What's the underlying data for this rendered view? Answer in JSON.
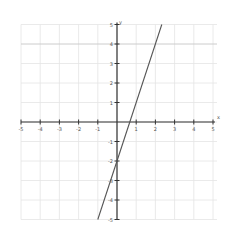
{
  "chart_data": {
    "type": "line",
    "title": "",
    "xlabel": "x",
    "ylabel": "y",
    "xlim": [
      -5,
      5
    ],
    "ylim": [
      -5,
      5
    ],
    "grid": true,
    "x_ticks": [
      -5,
      -4,
      -3,
      -2,
      -1,
      1,
      2,
      3,
      4,
      5
    ],
    "y_ticks": [
      5,
      4,
      3,
      2,
      1,
      -1,
      -2,
      -3,
      -4,
      -5
    ],
    "series": [
      {
        "name": "y = 3x - 2",
        "slope": 3,
        "intercept": -2,
        "x": [
          -1,
          2.333
        ],
        "y": [
          -5,
          5
        ]
      }
    ],
    "highlighted_gridline_y": 4
  },
  "colors": {
    "axis": "#333333",
    "grid": "#e4e4e4",
    "grid_highlight": "#cccccc",
    "line": "#555555",
    "background": "#ffffff"
  },
  "axes": {
    "x_label": "x",
    "y_label": "y"
  }
}
